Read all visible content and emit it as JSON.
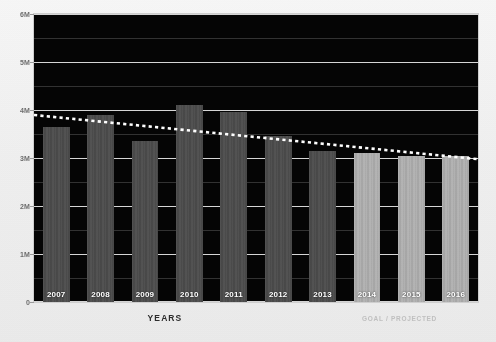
{
  "title": "",
  "axis": {
    "xlabel": "YEARS",
    "ylabel": "",
    "legend": "GOAL / PROJECTED"
  },
  "yticks": [
    "0",
    "1M",
    "2M",
    "3M",
    "4M",
    "5M",
    "6M"
  ],
  "colors": {
    "plot_background": "#050505",
    "bar_actual": "#4c4c4c",
    "bar_goal": "#b4b4b4",
    "gridline": "#e8e8e8",
    "trendline": "#ffffff",
    "page_background": "#efefef",
    "label_text": "#ffffff"
  },
  "chart_data": {
    "type": "bar",
    "title": "",
    "xlabel": "YEARS",
    "ylabel": "",
    "ylim": [
      0,
      6000000
    ],
    "ytick_values": [
      0,
      1000000,
      2000000,
      3000000,
      4000000,
      5000000,
      6000000
    ],
    "ytick_labels": [
      "0",
      "1M",
      "2M",
      "3M",
      "4M",
      "5M",
      "6M"
    ],
    "grid": true,
    "legend_position": "bottom-right",
    "categories": [
      "2007",
      "2008",
      "2009",
      "2010",
      "2011",
      "2012",
      "2013",
      "2014",
      "2015",
      "2016"
    ],
    "series": [
      {
        "name": "Actual",
        "color": "#4c4c4c",
        "values": [
          3650000,
          3900000,
          3350000,
          4100000,
          3950000,
          3450000,
          3150000,
          null,
          null,
          null
        ]
      },
      {
        "name": "GOAL / PROJECTED",
        "color": "#b4b4b4",
        "values": [
          null,
          null,
          null,
          null,
          null,
          null,
          null,
          3100000,
          3050000,
          3050000
        ]
      },
      {
        "name": "Trend",
        "type": "line",
        "style": "dotted",
        "color": "#ffffff",
        "values": [
          3850000,
          3760000,
          3660000,
          3570000,
          3470000,
          3380000,
          3290000,
          3200000,
          3110000,
          3020000
        ]
      }
    ]
  },
  "bars": [
    {
      "label": "2007",
      "value": 3650000,
      "kind": "actual"
    },
    {
      "label": "2008",
      "value": 3900000,
      "kind": "actual"
    },
    {
      "label": "2009",
      "value": 3350000,
      "kind": "actual"
    },
    {
      "label": "2010",
      "value": 4100000,
      "kind": "actual"
    },
    {
      "label": "2011",
      "value": 3950000,
      "kind": "actual"
    },
    {
      "label": "2012",
      "value": 3450000,
      "kind": "actual"
    },
    {
      "label": "2013",
      "value": 3150000,
      "kind": "actual"
    },
    {
      "label": "2014",
      "value": 3100000,
      "kind": "goal"
    },
    {
      "label": "2015",
      "value": 3050000,
      "kind": "goal"
    },
    {
      "label": "2016",
      "value": 3050000,
      "kind": "goal"
    }
  ]
}
